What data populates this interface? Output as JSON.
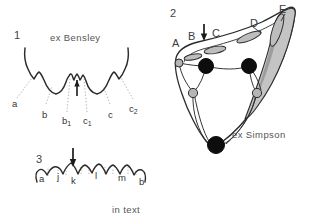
{
  "figure": {
    "background_color": "#ffffff",
    "ink_color": "#2b2b2b",
    "leader_color": "#9a9a9a",
    "shade_color": "#b9b9b9",
    "width": 309,
    "height": 224
  },
  "panels": [
    {
      "number": "1",
      "caption": "ex Bensley",
      "type": "crown-profile",
      "arrow": "down-arrow-marker",
      "labels": [
        {
          "id": "a",
          "text": "a",
          "x": 12,
          "y": 99
        },
        {
          "id": "b",
          "text": "b",
          "x": 42,
          "y": 110
        },
        {
          "id": "b1",
          "text": "b",
          "sub": "1",
          "x": 62,
          "y": 116
        },
        {
          "id": "c1",
          "text": "c",
          "sub": "1",
          "x": 83,
          "y": 116
        },
        {
          "id": "c",
          "text": "c",
          "x": 108,
          "y": 110
        },
        {
          "id": "c2",
          "text": "c",
          "sub": "2",
          "x": 129,
          "y": 104
        }
      ]
    },
    {
      "number": "2",
      "caption": "ex Simpson",
      "type": "occlusal-view",
      "arrow": "down-arrow-marker",
      "labels": [
        {
          "id": "A",
          "text": "A",
          "x": 172,
          "y": 38
        },
        {
          "id": "B",
          "text": "B",
          "x": 188,
          "y": 31
        },
        {
          "id": "C",
          "text": "C",
          "x": 212,
          "y": 28
        },
        {
          "id": "D",
          "text": "D",
          "x": 250,
          "y": 18
        },
        {
          "id": "E",
          "text": "E",
          "x": 279,
          "y": 4
        }
      ]
    },
    {
      "number": "3",
      "caption": "in text",
      "type": "crest-profile",
      "arrow": "down-arrow-marker",
      "labels": [
        {
          "id": "a",
          "text": "a",
          "x": 39,
          "y": 180
        },
        {
          "id": "j",
          "text": "j",
          "x": 57,
          "y": 178
        },
        {
          "id": "k",
          "text": "k",
          "x": 74,
          "y": 182
        },
        {
          "id": "l",
          "text": "l",
          "x": 95,
          "y": 176
        },
        {
          "id": "m",
          "text": "m",
          "x": 119,
          "y": 178
        },
        {
          "id": "b",
          "text": "b",
          "x": 140,
          "y": 182
        }
      ]
    }
  ],
  "panel_numbers": {
    "one": {
      "text": "1",
      "x": 14,
      "y": 30
    },
    "two": {
      "text": "2",
      "x": 170,
      "y": 8
    },
    "three": {
      "text": "3",
      "x": 36,
      "y": 154
    }
  },
  "captions": {
    "bensley": {
      "text": "ex Bensley",
      "x": 50,
      "y": 33
    },
    "simpson": {
      "text": "ex Simpson",
      "x": 232,
      "y": 130
    },
    "intext": {
      "text": "in text",
      "x": 112,
      "y": 205
    }
  }
}
